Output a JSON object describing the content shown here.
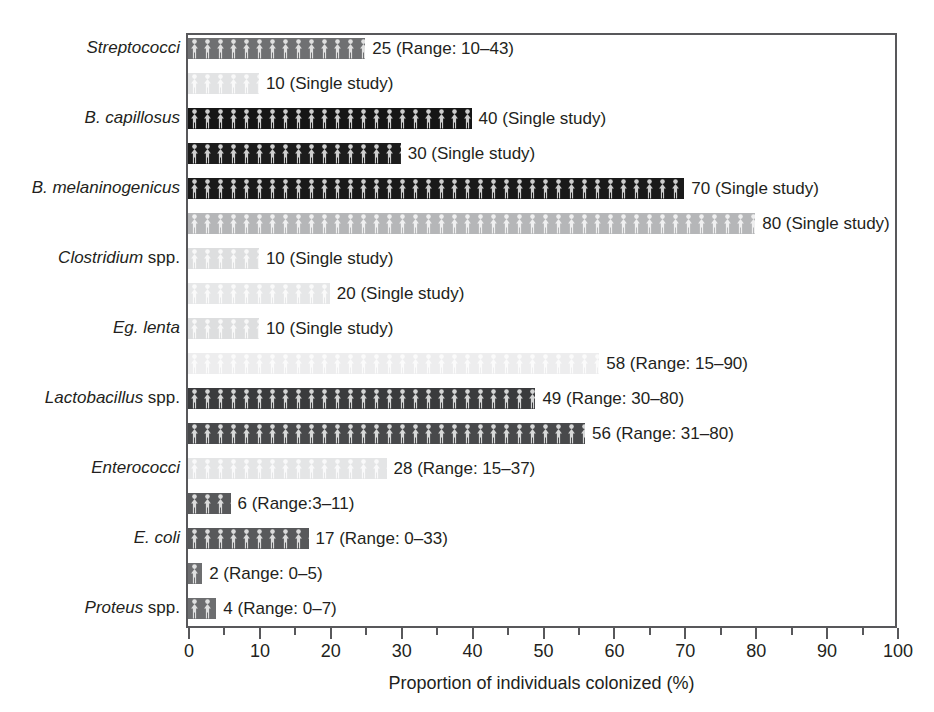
{
  "chart_data": {
    "type": "bar",
    "orientation": "horizontal",
    "title": "",
    "xlabel": "Proportion of individuals colonized (%)",
    "ylabel": "",
    "xlim": [
      0,
      100
    ],
    "xticks": [
      0,
      10,
      20,
      30,
      40,
      50,
      60,
      70,
      80,
      90,
      100
    ],
    "xtick_labels": [
      "0",
      "10",
      "20",
      "30",
      "40",
      "50",
      "60",
      "70",
      "80",
      "90",
      "100"
    ],
    "minor_tick_step": 5,
    "grid": false,
    "legend": null,
    "categories": [
      "Streptococci",
      "B. capillosus",
      "B. melaninogenicus",
      "Clostridium spp.",
      "Eg. lenta",
      "Lactobacillus spp.",
      "Enterococci",
      "E. coli",
      "Proteus spp."
    ],
    "bars": [
      {
        "category": "Streptococci",
        "value": 25,
        "annotation": "25 (Range: 10–43)",
        "shade": "#6f7072"
      },
      {
        "category": "Streptococci",
        "value": 10,
        "annotation": "10 (Single study)",
        "shade": "#e2e3e4"
      },
      {
        "category": "B. capillosus",
        "value": 40,
        "annotation": "40 (Single study)",
        "shade": "#161616"
      },
      {
        "category": "B. capillosus",
        "value": 30,
        "annotation": "30 (Single study)",
        "shade": "#1c1c1c"
      },
      {
        "category": "B. melaninogenicus",
        "value": 70,
        "annotation": "70 (Single study)",
        "shade": "#1a1a1a"
      },
      {
        "category": "B. melaninogenicus",
        "value": 80,
        "annotation": "80 (Single study)",
        "shade": "#b5b6b8"
      },
      {
        "category": "Clostridium spp.",
        "value": 10,
        "annotation": "10 (Single study)",
        "shade": "#dddedf"
      },
      {
        "category": "Clostridium spp.",
        "value": 20,
        "annotation": "20 (Single study)",
        "shade": "#e6e7e8"
      },
      {
        "category": "Eg. lenta",
        "value": 10,
        "annotation": "10 (Single study)",
        "shade": "#dddedf"
      },
      {
        "category": "Eg. lenta",
        "value": 58,
        "annotation": "58 (Range: 15–90)",
        "shade": "#ededee"
      },
      {
        "category": "Lactobacillus spp.",
        "value": 49,
        "annotation": "49 (Range: 30–80)",
        "shade": "#3a3b3d"
      },
      {
        "category": "Lactobacillus spp.",
        "value": 56,
        "annotation": "56 (Range: 31–80)",
        "shade": "#48494b"
      },
      {
        "category": "Enterococci",
        "value": 28,
        "annotation": "28 (Range: 15–37)",
        "shade": "#e4e5e6"
      },
      {
        "category": "Enterococci",
        "value": 6,
        "annotation": "6 (Range:3–11)",
        "shade": "#58595b"
      },
      {
        "category": "E. coli",
        "value": 17,
        "annotation": "17 (Range: 0–33)",
        "shade": "#58595b"
      },
      {
        "category": "E. coli",
        "value": 2,
        "annotation": "2 (Range: 0–5)",
        "shade": "#6d6e70"
      },
      {
        "category": "Proteus spp.",
        "value": 4,
        "annotation": "4 (Range: 0–7)",
        "shade": "#6d6e70"
      }
    ]
  },
  "axis": {
    "x_title": "Proportion of individuals colonized (%)",
    "tick_labels": [
      "0",
      "10",
      "20",
      "30",
      "40",
      "50",
      "60",
      "70",
      "80",
      "90",
      "100"
    ]
  },
  "category_labels": [
    {
      "italic": "Streptococci",
      "roman": "",
      "row": 0
    },
    {
      "italic": "B. capillosus",
      "roman": "",
      "row": 2
    },
    {
      "italic": "B. melaninogenicus",
      "roman": "",
      "row": 4
    },
    {
      "italic": "Clostridium",
      "roman": " spp.",
      "row": 6
    },
    {
      "italic": "Eg. lenta",
      "roman": "",
      "row": 8
    },
    {
      "italic": "Lactobacillus",
      "roman": " spp.",
      "row": 10
    },
    {
      "italic": "Enterococci",
      "roman": "",
      "row": 12
    },
    {
      "italic": "E. coli",
      "roman": "",
      "row": 14
    },
    {
      "italic": "Proteus",
      "roman": " spp.",
      "row": 16
    }
  ],
  "colors": {
    "frame": "#58585b",
    "text": "#231f20",
    "background": "#ffffff"
  }
}
